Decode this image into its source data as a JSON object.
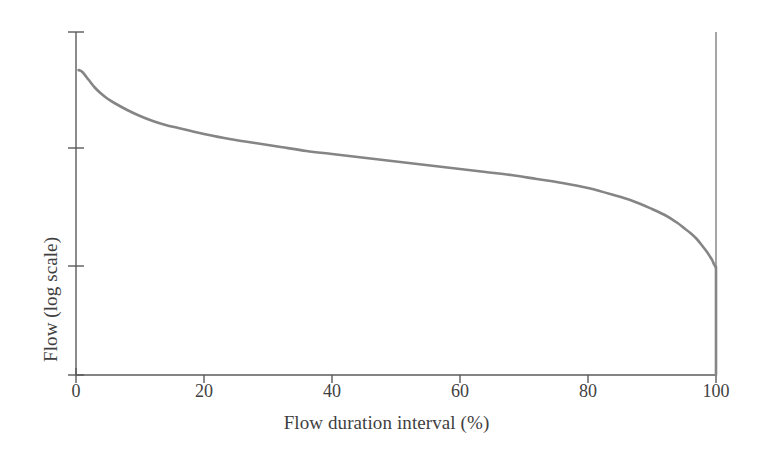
{
  "chart_data": {
    "type": "line",
    "title": "",
    "xlabel": "Flow duration interval (%)",
    "ylabel": "Flow (log scale)",
    "xlim": [
      0,
      100
    ],
    "ylim_note": "logarithmic, unlabeled axis spanning roughly 3 decades",
    "grid": false,
    "legend": null,
    "x_ticks": [
      0,
      20,
      40,
      60,
      80,
      100
    ],
    "x_tick_labels": [
      "0",
      "20",
      "40",
      "60",
      "80",
      "100"
    ],
    "y_ticks_unlabeled_count": 4,
    "y_tick_labels": [],
    "series": [
      {
        "name": "Flow duration curve",
        "color": "#858585",
        "x": [
          0.4,
          1,
          2,
          3,
          4,
          5,
          6,
          8,
          10,
          12,
          14,
          16,
          18,
          20,
          24,
          28,
          32,
          36,
          40,
          44,
          48,
          52,
          56,
          60,
          64,
          68,
          72,
          76,
          80,
          84,
          87,
          90,
          92,
          94,
          95,
          96,
          97,
          98,
          98.6,
          99.1,
          99.4,
          99.6,
          99.75,
          99.85,
          99.92,
          99.97,
          100,
          100,
          100
        ],
        "y_pixel": [
          70,
          72,
          80,
          88,
          94,
          99,
          103,
          110,
          116,
          121,
          125,
          128,
          131,
          134,
          139,
          143,
          147,
          151,
          154,
          157,
          160,
          163,
          166,
          169,
          172,
          175,
          179,
          183,
          188,
          195,
          201,
          209,
          215,
          223,
          228,
          233,
          239,
          247,
          252,
          257,
          260,
          263,
          265,
          266,
          267,
          268,
          269,
          300,
          375
        ],
        "y_relative": [
          0.99,
          0.98,
          0.93,
          0.88,
          0.85,
          0.82,
          0.8,
          0.76,
          0.73,
          0.71,
          0.69,
          0.67,
          0.66,
          0.64,
          0.62,
          0.6,
          0.58,
          0.56,
          0.54,
          0.53,
          0.51,
          0.5,
          0.48,
          0.47,
          0.46,
          0.44,
          0.42,
          0.41,
          0.38,
          0.36,
          0.33,
          0.3,
          0.28,
          0.26,
          0.24,
          0.22,
          0.2,
          0.18,
          0.16,
          0.14,
          0.13,
          0.12,
          0.11,
          0.11,
          0.1,
          0.1,
          0.1,
          0.0,
          0.0
        ],
        "description": "Monotonically decreasing flow duration curve; gentle concave decline from high flows at low exceedance to a steep near-vertical drop to zero flow at the 100% interval"
      }
    ],
    "annotations": [
      {
        "name": "right-boundary-line",
        "type": "vertical-line",
        "x": 100,
        "description": "thin vertical rule drawn at the 100% interval spanning the full plot height"
      }
    ]
  },
  "axes": {
    "x_title": "Flow duration interval (%)",
    "y_title": "Flow (log scale)",
    "x_tick_labels": [
      "0",
      "20",
      "40",
      "60",
      "80",
      "100"
    ],
    "line_color": "#5a5a5a",
    "curve_color": "#858585",
    "background": "#ffffff"
  }
}
